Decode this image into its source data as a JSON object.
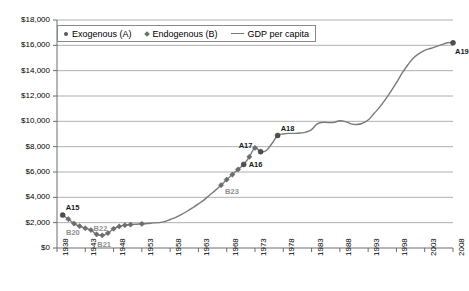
{
  "chart_data": {
    "type": "line",
    "title": "",
    "subtitle": "",
    "xlabel": "",
    "ylabel": "",
    "xlim": [
      1938,
      2008
    ],
    "ylim": [
      0,
      18000
    ],
    "grid": true,
    "grid_axis": "y",
    "legend_position": "top-left-inside",
    "y_tick_labels": [
      "$18,000",
      "$16,000",
      "$14,000",
      "$12,000",
      "$10,000",
      "$8,000",
      "$6,000",
      "$4,000",
      "$2,000",
      "$0"
    ],
    "y_ticks": [
      18000,
      16000,
      14000,
      12000,
      10000,
      8000,
      6000,
      4000,
      2000,
      0
    ],
    "x_tick_labels": [
      "1938",
      "1943",
      "1948",
      "1953",
      "1958",
      "1963",
      "1968",
      "1973",
      "1978",
      "1983",
      "1988",
      "1993",
      "1998",
      "2003",
      "2008"
    ],
    "x_ticks": [
      1938,
      1943,
      1948,
      1953,
      1958,
      1963,
      1968,
      1973,
      1978,
      1983,
      1988,
      1993,
      1998,
      2003,
      2008
    ],
    "legend": [
      {
        "label": "Exogenous (A)",
        "marker": "round-dot",
        "color": "#595959"
      },
      {
        "label": "Endogenous (B)",
        "marker": "diamond",
        "color": "#6e6e6e"
      },
      {
        "label": "GDP per capita",
        "marker": "line",
        "color": "#7a7a7a"
      }
    ],
    "series": [
      {
        "name": "GDP per capita",
        "color": "#7a7a7a",
        "x": [
          1939,
          1940,
          1941,
          1942,
          1943,
          1944,
          1945,
          1946,
          1947,
          1948,
          1949,
          1950,
          1951,
          1952,
          1953,
          1954,
          1955,
          1956,
          1957,
          1958,
          1959,
          1960,
          1961,
          1962,
          1963,
          1964,
          1965,
          1966,
          1967,
          1968,
          1969,
          1970,
          1971,
          1972,
          1973,
          1974,
          1975,
          1976,
          1977,
          1978,
          1979,
          1980,
          1981,
          1982,
          1983,
          1984,
          1985,
          1986,
          1987,
          1988,
          1989,
          1990,
          1991,
          1992,
          1993,
          1994,
          1995,
          1996,
          1997,
          1998,
          1999,
          2000,
          2001,
          2002,
          2003,
          2004,
          2005,
          2006,
          2007,
          2008
        ],
        "y": [
          2600,
          2280,
          1930,
          1720,
          1560,
          1420,
          1080,
          1000,
          1180,
          1520,
          1700,
          1800,
          1850,
          1880,
          1900,
          1930,
          1980,
          2000,
          2080,
          2250,
          2420,
          2650,
          2900,
          3180,
          3480,
          3800,
          4180,
          4550,
          4960,
          5400,
          5800,
          6200,
          6600,
          7200,
          7900,
          7600,
          7700,
          8250,
          8880,
          9000,
          9050,
          9050,
          9080,
          9150,
          9350,
          9800,
          9920,
          9900,
          9920,
          10050,
          9980,
          9800,
          9750,
          9850,
          10100,
          10600,
          11100,
          11700,
          12350,
          13050,
          13800,
          14450,
          15000,
          15350,
          15600,
          15750,
          15900,
          16050,
          16200,
          16200
        ]
      }
    ],
    "annotated_points": [
      {
        "label": "A15",
        "group": "Exogenous (A)",
        "x": 1939,
        "y": 2600,
        "marker": "round-dot",
        "label_pos": "above-right"
      },
      {
        "label": "A16",
        "group": "Exogenous (A)",
        "x": 1971,
        "y": 6600,
        "marker": "round-dot",
        "label_pos": "right"
      },
      {
        "label": "A17",
        "group": "Exogenous (A)",
        "x": 1974,
        "y": 7600,
        "marker": "round-dot",
        "label_pos": "above-left"
      },
      {
        "label": "A18",
        "group": "Exogenous (A)",
        "x": 1977,
        "y": 8880,
        "marker": "round-dot",
        "label_pos": "above-right"
      },
      {
        "label": "A19",
        "group": "Exogenous (A)",
        "x": 2008,
        "y": 16200,
        "marker": "round-dot",
        "label_pos": "below-right"
      },
      {
        "label": "B20",
        "group": "Endogenous (B)",
        "x": 1941,
        "y": 1930,
        "marker": "diamond",
        "label_pos": "below-left"
      },
      {
        "label": "B21",
        "group": "Endogenous (B)",
        "x": 1946,
        "y": 1000,
        "marker": "diamond",
        "label_pos": "below"
      },
      {
        "label": "B22",
        "group": "Endogenous (B)",
        "x": 1945,
        "y": 1080,
        "marker": "diamond",
        "label_pos": "above-right"
      },
      {
        "label": "B23",
        "group": "Endogenous (B)",
        "x": 1967,
        "y": 4960,
        "marker": "diamond",
        "label_pos": "below-right"
      }
    ],
    "marker_points": [
      {
        "x": 1939,
        "y": 2600,
        "marker": "round-dot"
      },
      {
        "x": 1940,
        "y": 2280,
        "marker": "diamond"
      },
      {
        "x": 1941,
        "y": 1930,
        "marker": "diamond"
      },
      {
        "x": 1942,
        "y": 1720,
        "marker": "diamond"
      },
      {
        "x": 1943,
        "y": 1560,
        "marker": "diamond"
      },
      {
        "x": 1944,
        "y": 1420,
        "marker": "diamond"
      },
      {
        "x": 1945,
        "y": 1080,
        "marker": "diamond"
      },
      {
        "x": 1946,
        "y": 1000,
        "marker": "diamond"
      },
      {
        "x": 1947,
        "y": 1180,
        "marker": "diamond"
      },
      {
        "x": 1948,
        "y": 1520,
        "marker": "diamond"
      },
      {
        "x": 1949,
        "y": 1700,
        "marker": "diamond"
      },
      {
        "x": 1950,
        "y": 1800,
        "marker": "diamond"
      },
      {
        "x": 1951,
        "y": 1850,
        "marker": "diamond"
      },
      {
        "x": 1953,
        "y": 1900,
        "marker": "diamond"
      },
      {
        "x": 1967,
        "y": 4960,
        "marker": "diamond"
      },
      {
        "x": 1968,
        "y": 5400,
        "marker": "diamond"
      },
      {
        "x": 1969,
        "y": 5800,
        "marker": "diamond"
      },
      {
        "x": 1970,
        "y": 6200,
        "marker": "diamond"
      },
      {
        "x": 1971,
        "y": 6600,
        "marker": "round-dot"
      },
      {
        "x": 1972,
        "y": 7200,
        "marker": "diamond"
      },
      {
        "x": 1973,
        "y": 7900,
        "marker": "diamond"
      },
      {
        "x": 1974,
        "y": 7600,
        "marker": "round-dot"
      },
      {
        "x": 1977,
        "y": 8880,
        "marker": "round-dot"
      },
      {
        "x": 2008,
        "y": 16200,
        "marker": "round-dot"
      }
    ]
  }
}
